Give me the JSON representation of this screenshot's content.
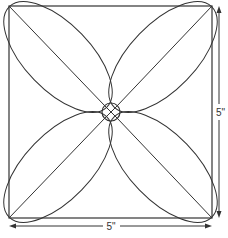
{
  "diagram": {
    "labels": {
      "width": "5\"",
      "height": "5\""
    },
    "colors": {
      "stroke": "#333333",
      "background": "#ffffff"
    },
    "square": {
      "x": 9,
      "y": 6,
      "w": 203,
      "h": 212
    },
    "center_circle": {
      "cx": 111,
      "cy": 112,
      "r": 9
    }
  }
}
